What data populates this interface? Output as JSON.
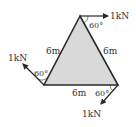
{
  "diagram": {
    "type": "triangular truss with applied forces",
    "colors": {
      "fill": "#d9d9d9",
      "stroke": "#2a2a2a",
      "text": "#333333"
    },
    "sides": [
      {
        "id": "left",
        "label": "6m"
      },
      {
        "id": "right",
        "label": "6m"
      },
      {
        "id": "bottom",
        "label": "6m"
      }
    ],
    "forces": [
      {
        "id": "top",
        "label": "1kN",
        "angle_label": "60°",
        "direction": "horizontal right"
      },
      {
        "id": "left",
        "label": "1kN",
        "angle_label": "60°",
        "direction": "up-left"
      },
      {
        "id": "bottom-right",
        "label": "1kN",
        "angle_label": "60°",
        "direction": "down-left"
      }
    ]
  }
}
